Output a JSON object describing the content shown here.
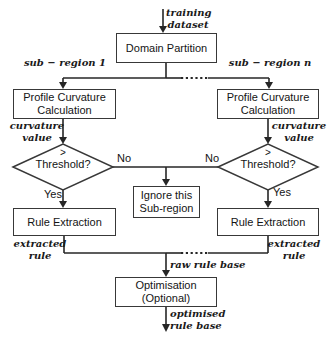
{
  "colors": {
    "background": "#ffffff",
    "line": "#262626",
    "box_border": "#383838",
    "box_fill": "#ffffff",
    "text": "#141414"
  },
  "nodes": {
    "domain_partition": {
      "label": "Domain Partition"
    },
    "profile_curvature": {
      "line1": "Profile Curvature",
      "line2": "Calculation"
    },
    "threshold_decision": {
      "line1": ">",
      "line2": "Threshold?"
    },
    "ignore_subregion": {
      "line1": "Ignore this",
      "line2": "Sub-region"
    },
    "rule_extraction": {
      "label": "Rule Extraction"
    },
    "optimisation": {
      "line1": "Optimisation",
      "line2": "(Optional)"
    }
  },
  "edge_labels": {
    "training_dataset": {
      "line1": "training",
      "line2": "dataset"
    },
    "sub_region_1": "sub − region 1",
    "sub_region_n": "sub − region n",
    "curvature_value": {
      "line1": "curvature",
      "line2": "value"
    },
    "no": "No",
    "yes": "Yes",
    "extracted_rule": {
      "line1": "extracted",
      "line2": "rule"
    },
    "raw_rule_base": "raw rule base",
    "optimised_rule_base": {
      "line1": "optimised",
      "line2": "rule base"
    }
  }
}
